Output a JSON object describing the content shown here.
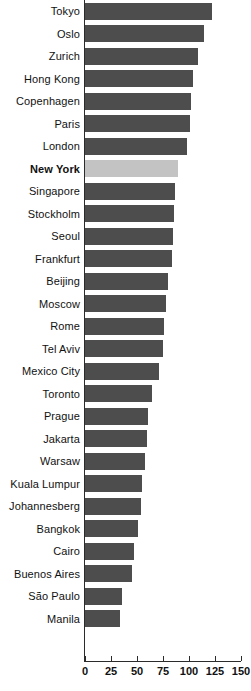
{
  "chart_data": {
    "type": "bar",
    "orientation": "horizontal",
    "title": "",
    "xlabel": "",
    "ylabel": "",
    "xlim": [
      0,
      150
    ],
    "xticks": [
      0,
      25,
      50,
      75,
      100,
      125,
      150
    ],
    "grid": false,
    "legend": null,
    "bar_color": "#4d4d4d",
    "highlight_color": "#c3c3c3",
    "highlight_category": "New York",
    "categories": [
      "Tokyo",
      "Oslo",
      "Zurich",
      "Hong Kong",
      "Copenhagen",
      "Paris",
      "London",
      "New York",
      "Singapore",
      "Stockholm",
      "Seoul",
      "Frankfurt",
      "Beijing",
      "Moscow",
      "Rome",
      "Tel Aviv",
      "Mexico City",
      "Toronto",
      "Prague",
      "Jakarta",
      "Warsaw",
      "Kuala Lumpur",
      "Johannesberg",
      "Bangkok",
      "Cairo",
      "Buenos Aires",
      "São Paulo",
      "Manila"
    ],
    "values": [
      122,
      114,
      109,
      104,
      102,
      101,
      98,
      89,
      87,
      86,
      85,
      84,
      80,
      78,
      76,
      75,
      71,
      64,
      61,
      60,
      58,
      55,
      54,
      51,
      47,
      45,
      36,
      34
    ]
  },
  "axis": {
    "tick_labels": [
      "0",
      "25",
      "50",
      "75",
      "100",
      "125",
      "150"
    ]
  }
}
